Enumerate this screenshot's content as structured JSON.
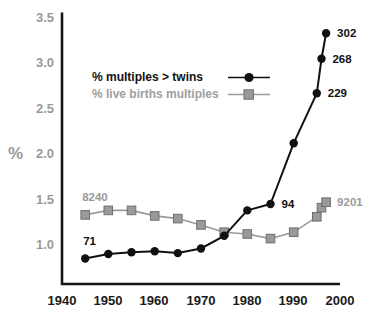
{
  "chart_data": {
    "type": "line",
    "title": "",
    "subtitle": "",
    "xlabel": "",
    "ylabel": "%",
    "xlim": [
      1940,
      2000
    ],
    "ylim": [
      0.65,
      3.55
    ],
    "xticks": [
      1940,
      1950,
      1960,
      1970,
      1980,
      1990,
      2000
    ],
    "yticks": [
      1.0,
      1.5,
      2.0,
      2.5,
      3.0,
      3.5
    ],
    "grid": false,
    "legend_position": "upper-left-inside",
    "x": [
      1945,
      1950,
      1955,
      1960,
      1965,
      1970,
      1975,
      1980,
      1985,
      1990,
      1995,
      1996,
      1997
    ],
    "series": [
      {
        "name": "% multiples > twins",
        "marker": "circle",
        "color": "#111111",
        "values": [
          0.84,
          0.89,
          0.91,
          0.92,
          0.9,
          0.95,
          1.09,
          1.37,
          1.44,
          2.11,
          2.66,
          3.04,
          3.32
        ]
      },
      {
        "name": "% live births multiples",
        "marker": "square",
        "color": "#9a9a9a",
        "values": [
          1.32,
          1.37,
          1.37,
          1.31,
          1.28,
          1.21,
          1.13,
          1.11,
          1.06,
          1.13,
          1.3,
          1.4,
          1.46
        ]
      }
    ],
    "annotations": [
      {
        "text": "71",
        "x": 1945,
        "y": 0.84,
        "color": "#111111",
        "dx": -2,
        "dy": -17
      },
      {
        "text": "94",
        "x": 1985,
        "y": 1.44,
        "color": "#111111",
        "dx": 11,
        "dy": 1
      },
      {
        "text": "229",
        "x": 1995,
        "y": 2.66,
        "color": "#111111",
        "dx": 11,
        "dy": 1
      },
      {
        "text": "268",
        "x": 1996,
        "y": 3.04,
        "color": "#111111",
        "dx": 11,
        "dy": 1
      },
      {
        "text": "302",
        "x": 1997,
        "y": 3.32,
        "color": "#111111",
        "dx": 11,
        "dy": 1
      },
      {
        "text": "8240",
        "x": 1945,
        "y": 1.32,
        "color": "#9a9a9a",
        "dx": -3,
        "dy": -17
      },
      {
        "text": "9201",
        "x": 1997,
        "y": 1.46,
        "color": "#9a9a9a",
        "dx": 11,
        "dy": 1
      }
    ]
  },
  "legend": {
    "items": [
      {
        "label": "% multiples > twins",
        "marker": "circle",
        "color": "#111111"
      },
      {
        "label": "% live births multiples",
        "marker": "square",
        "color": "#9a9a9a"
      }
    ]
  },
  "axes": {
    "y_title": "%",
    "x_tick_labels": [
      "1940",
      "1950",
      "1960",
      "1970",
      "1980",
      "1990",
      "2000"
    ],
    "y_tick_labels": [
      "3.5",
      "3.0",
      "2.5",
      "2.0",
      "1.5",
      "1.0"
    ]
  }
}
